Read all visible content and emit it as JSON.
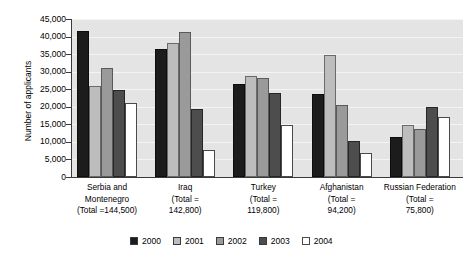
{
  "chart_data": {
    "type": "bar",
    "title": "",
    "subtitle": "",
    "xlabel": "",
    "ylabel": "Number of applicants",
    "ylim": [
      0,
      45000
    ],
    "ytick_labels": [
      "45,000",
      "40,000",
      "35,000",
      "30,000",
      "25,000",
      "20,000",
      "15,000",
      "10,000",
      "5,000",
      "0"
    ],
    "ytick_values": [
      45000,
      40000,
      35000,
      30000,
      25000,
      20000,
      15000,
      10000,
      5000,
      0
    ],
    "grid": true,
    "grid_axis": "y",
    "legend_position": "bottom",
    "categories": [
      "Serbia and Montenegro (Total =144,500)",
      "Iraq (Total = 142,800)",
      "Turkey (Total = 119,800)",
      "Afghanistan (Total = 94,200)",
      "Russian Federation (Total = 75,800)"
    ],
    "category_lines": [
      [
        "Serbia and",
        "Montenegro",
        "(Total =144,500)"
      ],
      [
        "Iraq",
        "(Total =",
        "142,800)"
      ],
      [
        "Turkey",
        "(Total =",
        "119,800)"
      ],
      [
        "Afghanistan",
        "(Total =",
        "94,200)"
      ],
      [
        "Russian Federation",
        "(Total =",
        "75,800)"
      ]
    ],
    "category_totals": [
      144500,
      142800,
      119800,
      94200,
      75800
    ],
    "series": [
      {
        "name": "2000",
        "color": "#1c1c1c",
        "values": [
          41700,
          36500,
          26400,
          23600,
          11400
        ]
      },
      {
        "name": "2001",
        "color": "#bdbdbd",
        "values": [
          26000,
          38300,
          28900,
          34800,
          14700
        ]
      },
      {
        "name": "2002",
        "color": "#9a9a9a",
        "values": [
          31100,
          41200,
          28200,
          20400,
          13800
        ]
      },
      {
        "name": "2003",
        "color": "#4d4d4d",
        "values": [
          24700,
          19300,
          23800,
          10300,
          19800
        ]
      },
      {
        "name": "2004",
        "color": "#ffffff",
        "values": [
          21000,
          7700,
          14700,
          6900,
          17200
        ]
      }
    ]
  },
  "legend": {
    "items": [
      {
        "label": "2000",
        "color": "#1c1c1c"
      },
      {
        "label": "2001",
        "color": "#bdbdbd"
      },
      {
        "label": "2002",
        "color": "#9a9a9a"
      },
      {
        "label": "2003",
        "color": "#4d4d4d"
      },
      {
        "label": "2004",
        "color": "#ffffff"
      }
    ]
  }
}
